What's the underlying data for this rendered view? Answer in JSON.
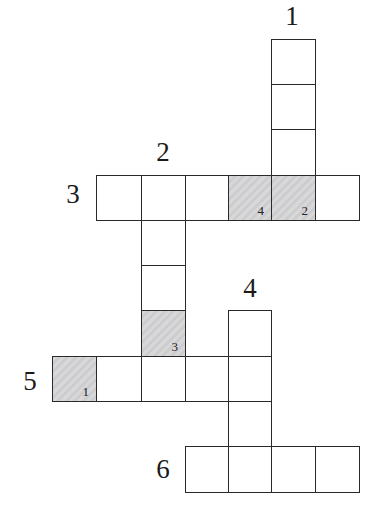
{
  "puzzle": {
    "type": "crossword",
    "grid": {
      "col_x": [
        52,
        96,
        141,
        185,
        228,
        271,
        315
      ],
      "row_y": [
        39,
        84,
        129,
        175,
        220,
        265,
        310,
        356,
        401,
        446
      ],
      "cell_w": 44,
      "cell_h": 46
    },
    "colors": {
      "border": "#2a2a2a",
      "empty": "#ffffff",
      "shaded": "#cfcfd1"
    },
    "clue_numbers": [
      {
        "label": "1",
        "x": 292,
        "y": 16
      },
      {
        "label": "2",
        "x": 163,
        "y": 152
      },
      {
        "label": "3",
        "x": 73,
        "y": 194
      },
      {
        "label": "4",
        "x": 250,
        "y": 288
      },
      {
        "label": "5",
        "x": 30,
        "y": 381
      },
      {
        "label": "6",
        "x": 163,
        "y": 469
      }
    ],
    "words": [
      {
        "number": "1",
        "direction": "down",
        "start": [
          0,
          5
        ],
        "length": 4
      },
      {
        "number": "2",
        "direction": "down",
        "start": [
          3,
          2
        ],
        "length": 5
      },
      {
        "number": "3",
        "direction": "across",
        "start": [
          3,
          1
        ],
        "length": 6
      },
      {
        "number": "4",
        "direction": "down",
        "start": [
          6,
          4
        ],
        "length": 4
      },
      {
        "number": "5",
        "direction": "across",
        "start": [
          7,
          0
        ],
        "length": 5
      },
      {
        "number": "6",
        "direction": "across",
        "start": [
          9,
          3
        ],
        "length": 4
      }
    ],
    "cells": [
      {
        "row": 0,
        "col": 5
      },
      {
        "row": 1,
        "col": 5
      },
      {
        "row": 2,
        "col": 5
      },
      {
        "row": 3,
        "col": 1
      },
      {
        "row": 3,
        "col": 2
      },
      {
        "row": 3,
        "col": 3
      },
      {
        "row": 3,
        "col": 4,
        "shaded": true,
        "key": "4"
      },
      {
        "row": 3,
        "col": 5,
        "shaded": true,
        "key": "2"
      },
      {
        "row": 3,
        "col": 6
      },
      {
        "row": 4,
        "col": 2
      },
      {
        "row": 5,
        "col": 2
      },
      {
        "row": 6,
        "col": 2,
        "shaded": true,
        "key": "3"
      },
      {
        "row": 6,
        "col": 4
      },
      {
        "row": 7,
        "col": 0,
        "shaded": true,
        "key": "1"
      },
      {
        "row": 7,
        "col": 1
      },
      {
        "row": 7,
        "col": 2
      },
      {
        "row": 7,
        "col": 3
      },
      {
        "row": 7,
        "col": 4
      },
      {
        "row": 8,
        "col": 4
      },
      {
        "row": 9,
        "col": 3
      },
      {
        "row": 9,
        "col": 4
      },
      {
        "row": 9,
        "col": 5
      },
      {
        "row": 9,
        "col": 6
      }
    ]
  }
}
